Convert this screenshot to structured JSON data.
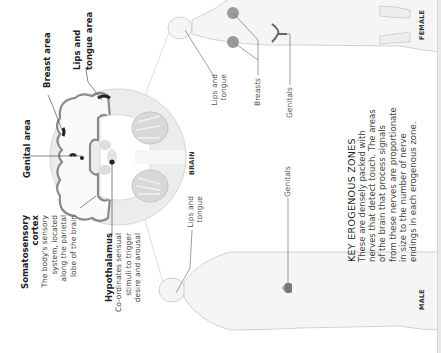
{
  "brain": {
    "caption": "BRAIN",
    "labels": {
      "genital_area": "Genital area",
      "breast_area": "Breast area",
      "lips_tongue_area_1": "Lips and",
      "lips_tongue_area_2": "tongue area"
    },
    "somatosensory": {
      "title_1": "Somatosensory",
      "title_2": "cortex",
      "desc": [
        "The body's sensory",
        "system, located",
        "along the parietal",
        "lobe of the brain"
      ]
    },
    "hypothalamus": {
      "title": "Hypothalamus",
      "desc": [
        "Co-ordinates sensual",
        "stimuli to trigger",
        "desire and arousal"
      ]
    }
  },
  "female": {
    "caption": "FEMALE",
    "labels": {
      "lips_1": "Lips and",
      "lips_2": "tongue",
      "breasts": "Breasts",
      "genitals": "Genitals"
    }
  },
  "male": {
    "caption": "MALE",
    "labels": {
      "lips_1": "Lips and",
      "lips_2": "tongue",
      "genitals": "Genitals"
    }
  },
  "key": {
    "title": "KEY EROGENOUS ZONES",
    "body": [
      "These are densely packed with",
      "nerves that detect touch. The areas",
      "of the brain that process signals",
      "from these nerves are proportionate",
      "in size to the number of nerve",
      "endings in each erogenous zone."
    ]
  },
  "colors": {
    "cortex_highlight": "#222222",
    "brain_fill": "#e8e8e8",
    "body_outline": "#cfcfcf"
  }
}
